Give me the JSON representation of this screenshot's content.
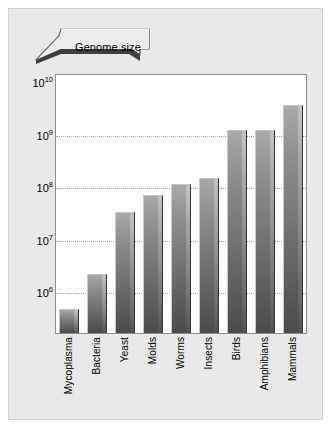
{
  "figure": {
    "callout_label": "Genome size",
    "callout_icon": "banner-arrow-icon"
  },
  "chart_data": {
    "type": "bar",
    "title": "Genome size",
    "xlabel": "",
    "ylabel": "",
    "scale": "log",
    "grid": true,
    "legend": "none",
    "ylim": [
      100000,
      10000000000
    ],
    "ytick_labels": [
      "10¹⁰",
      "10⁹",
      "10⁸",
      "10⁷",
      "10⁶"
    ],
    "ytick_values": [
      10000000000,
      1000000000,
      100000000,
      10000000,
      1000000
    ],
    "ytick_mantissa": [
      "10",
      "10",
      "10",
      "10",
      "10"
    ],
    "ytick_exponent": [
      "10",
      "9",
      "8",
      "7",
      "6"
    ],
    "categories": [
      "Mycoplasma",
      "Bacteria",
      "Yeast",
      "Molds",
      "Worms",
      "Insects",
      "Birds",
      "Amphibians",
      "Mammals"
    ],
    "values": [
      500000,
      2200000,
      30000000,
      63000000,
      100000000,
      130000000,
      1000000000,
      1000000000,
      2800000000
    ],
    "value_exponents": [
      5.7,
      6.34,
      7.48,
      7.8,
      8.0,
      8.11,
      9.0,
      9.0,
      9.45
    ],
    "bar_color_top": "#a9a9a9",
    "bar_color_bottom": "#4a4a4a",
    "plot_background": "#ffffff",
    "figure_background": "#e9e9e9",
    "gridline_color": "#9aa8a0"
  }
}
